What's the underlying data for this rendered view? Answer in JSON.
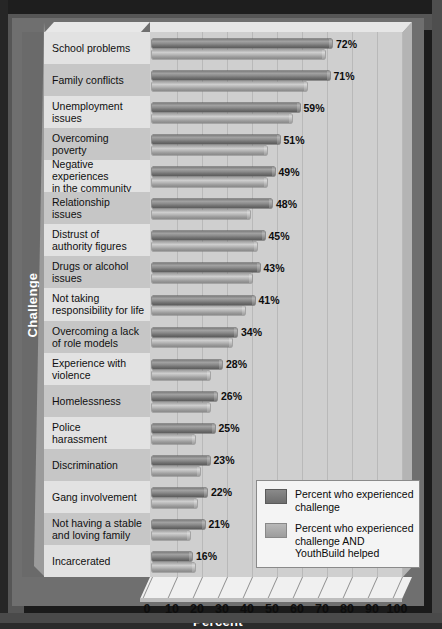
{
  "chart_data": {
    "type": "bar",
    "title": "",
    "xlabel": "Percent",
    "ylabel": "Challenge",
    "orientation": "horizontal",
    "xlim": [
      0,
      100
    ],
    "xticks": [
      "0",
      "10",
      "20",
      "30",
      "40",
      "50",
      "60",
      "70",
      "80",
      "90",
      "100"
    ],
    "grid": true,
    "legend_position": "bottom-right",
    "legend": [
      "Percent who experienced challenge",
      "Percent who experienced challenge AND YouthBuild helped"
    ],
    "categories": [
      "School problems",
      "Family conflicts",
      "Unemployment issues",
      "Overcoming poverty",
      "Negative experiences in the community",
      "Relationship issues",
      "Distrust of authority figures",
      "Drugs or alcohol issues",
      "Not taking responsibility for life",
      "Overcoming a lack of role models",
      "Experience with violence",
      "Homelessness",
      "Police harassment",
      "Discrimination",
      "Gang involvement",
      "Not having a stable and loving family",
      "Incarcerated"
    ],
    "series": [
      {
        "name": "Percent who experienced challenge",
        "color": "#7d7d7d",
        "values": [
          72,
          71,
          59,
          51,
          49,
          48,
          45,
          43,
          41,
          34,
          28,
          26,
          25,
          23,
          22,
          21,
          16
        ]
      },
      {
        "name": "Percent who experienced challenge AND YouthBuild helped",
        "color": "#b0b0b0",
        "values": [
          69,
          62,
          56,
          46,
          46,
          39,
          42,
          40,
          37,
          32,
          23,
          23,
          17,
          19,
          18,
          15,
          17
        ]
      }
    ],
    "data_labels": [
      "72%",
      "71%",
      "59%",
      "51%",
      "49%",
      "48%",
      "45%",
      "43%",
      "41%",
      "34%",
      "28%",
      "26%",
      "25%",
      "23%",
      "22%",
      "21%",
      "16%"
    ]
  },
  "axis": {
    "y_title": "Challenge",
    "x_title": "Percent",
    "x_ticks": [
      "0",
      "10",
      "20",
      "30",
      "40",
      "50",
      "60",
      "70",
      "80",
      "90",
      "100"
    ]
  },
  "labels": [
    {
      "lines": [
        "School problems"
      ]
    },
    {
      "lines": [
        "Family conflicts"
      ]
    },
    {
      "lines": [
        "Unemployment",
        "issues"
      ]
    },
    {
      "lines": [
        "Overcoming",
        "poverty"
      ]
    },
    {
      "lines": [
        "Negative experiences",
        "in the community"
      ]
    },
    {
      "lines": [
        "Relationship",
        "issues"
      ]
    },
    {
      "lines": [
        "Distrust of",
        "authority figures"
      ]
    },
    {
      "lines": [
        "Drugs or alcohol",
        "issues"
      ]
    },
    {
      "lines": [
        "Not taking",
        "responsibility for life"
      ]
    },
    {
      "lines": [
        "Overcoming a lack",
        "of role models"
      ]
    },
    {
      "lines": [
        "Experience with",
        "violence"
      ]
    },
    {
      "lines": [
        "Homelessness"
      ]
    },
    {
      "lines": [
        "Police",
        "harassment"
      ]
    },
    {
      "lines": [
        "Discrimination"
      ]
    },
    {
      "lines": [
        "Gang involvement"
      ]
    },
    {
      "lines": [
        "Not having a stable",
        "and loving family"
      ]
    },
    {
      "lines": [
        "Incarcerated"
      ]
    }
  ],
  "legend": {
    "entries": [
      {
        "swatch": "dark",
        "lines": [
          "Percent who experienced",
          "challenge"
        ]
      },
      {
        "swatch": "light",
        "lines": [
          "Percent who experienced",
          "challenge AND",
          "YouthBuild helped"
        ]
      }
    ]
  },
  "colors": {
    "background": "#565656",
    "plate": "#6f6f6f",
    "plot_area": "#cfcfcf",
    "label_panel": "#d8d8d8",
    "series_1": "#7d7d7d",
    "series_2": "#b0b0b0",
    "axis_title": "#ffffff"
  }
}
